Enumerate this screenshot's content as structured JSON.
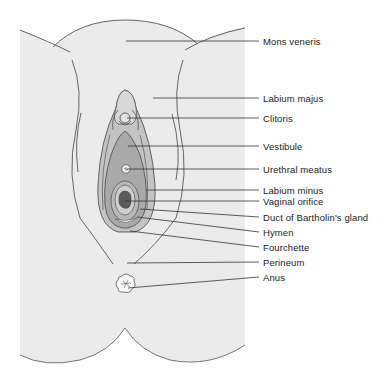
{
  "diagram": {
    "colors": {
      "background": "#ffffff",
      "skin": "#ebebeb",
      "outline": "#555555",
      "labia_minora": "#bdbdbd",
      "vestibule": "#a9a9a9",
      "orifice": "#5a5a5a",
      "leader": "#333333",
      "text": "#222222"
    },
    "labels": [
      {
        "id": "mons-veneris",
        "text": "Mons veneris",
        "y": 41
      },
      {
        "id": "labium-majus",
        "text": "Labium majus",
        "y": 98
      },
      {
        "id": "clitoris",
        "text": "Clitoris",
        "y": 118
      },
      {
        "id": "vestibule",
        "text": "Vestibule",
        "y": 146
      },
      {
        "id": "urethral-meatus",
        "text": "Urethral meatus",
        "y": 169
      },
      {
        "id": "labium-minus",
        "text": "Labium minus",
        "y": 190
      },
      {
        "id": "vaginal-orifice",
        "text": "Vaginal orifice",
        "y": 201
      },
      {
        "id": "duct-of-bartholins-gland",
        "text": "Duct of Bartholin's gland",
        "y": 217
      },
      {
        "id": "hymen",
        "text": "Hymen",
        "y": 232
      },
      {
        "id": "fourchette",
        "text": "Fourchette",
        "y": 247
      },
      {
        "id": "perineum",
        "text": "Perineum",
        "y": 262
      },
      {
        "id": "anus",
        "text": "Anus",
        "y": 277
      }
    ]
  }
}
